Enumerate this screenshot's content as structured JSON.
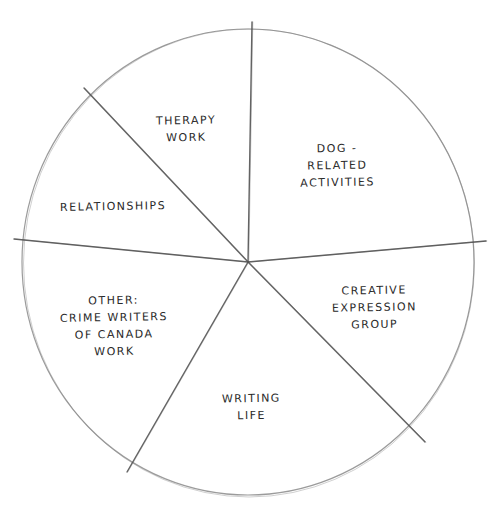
{
  "chart_data": {
    "type": "pie",
    "title": "",
    "style": "hand-drawn pencil sketch, no fills, no numeric labels",
    "center": [
      248,
      262
    ],
    "radius_px": 234,
    "categories": [
      "Dog-Related Activities",
      "Therapy Work",
      "Relationships",
      "Other: Crime Writers of Canada Work",
      "Writing Life",
      "Creative Expression Group"
    ],
    "values": [
      23.6,
      11.9,
      11.4,
      18.3,
      20.8,
      13.9
    ],
    "value_unit": "percent (estimated from slice angles)",
    "slices": [
      {
        "label_lines": [
          "Dog -",
          "Related",
          "Activities"
        ],
        "start_deg": 5,
        "end_deg": 90,
        "label_pos": [
          300,
          140
        ]
      },
      {
        "label_lines": [
          "Therapy",
          "Work"
        ],
        "start_deg": 90,
        "end_deg": 133,
        "label_pos": [
          156,
          112
        ]
      },
      {
        "label_lines": [
          "Relationships"
        ],
        "start_deg": 133,
        "end_deg": 174,
        "label_pos": [
          60,
          198
        ]
      },
      {
        "label_lines": [
          "Other:",
          "Crime Writers",
          "of Canada",
          "Work"
        ],
        "start_deg": 174,
        "end_deg": 240,
        "label_pos": [
          60,
          292
        ]
      },
      {
        "label_lines": [
          "Writing",
          "Life"
        ],
        "start_deg": 240,
        "end_deg": 315,
        "label_pos": [
          222,
          390
        ]
      },
      {
        "label_lines": [
          "Creative",
          "Expression",
          "Group"
        ],
        "start_deg": 315,
        "end_deg": 365,
        "label_pos": [
          332,
          282
        ]
      }
    ],
    "divider_lines": [
      {
        "from": [
          248,
          262
        ],
        "to": [
          252,
          22
        ]
      },
      {
        "from": [
          248,
          262
        ],
        "to": [
          486,
          241
        ]
      },
      {
        "from": [
          248,
          262
        ],
        "to": [
          425,
          442
        ]
      },
      {
        "from": [
          248,
          262
        ],
        "to": [
          127,
          472
        ]
      },
      {
        "from": [
          248,
          262
        ],
        "to": [
          14,
          239
        ]
      },
      {
        "from": [
          248,
          262
        ],
        "to": [
          84,
          88
        ]
      }
    ],
    "legend": "none",
    "stroke_color": "#8a8a8a",
    "divider_color": "#555555",
    "text_color": "#2a2a2a"
  }
}
